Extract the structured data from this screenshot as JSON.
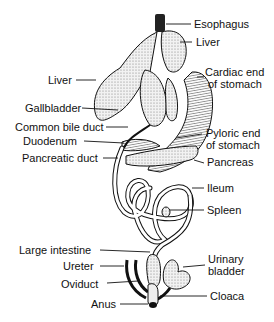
{
  "diagram": {
    "type": "anatomy-illustration",
    "labels_right": [
      {
        "id": "esophagus",
        "text": "Esophagus"
      },
      {
        "id": "liver-right",
        "text": "Liver"
      },
      {
        "id": "cardiac-end",
        "text": "Cardiac end\nof stomach",
        "line1": "Cardiac end",
        "line2": "of stomach"
      },
      {
        "id": "pyloric-end",
        "text": "Pyloric end\nof stomach",
        "line1": "Pyloric end",
        "line2": "of stomach"
      },
      {
        "id": "pancreas",
        "text": "Pancreas"
      },
      {
        "id": "ileum",
        "text": "Ileum"
      },
      {
        "id": "spleen",
        "text": "Spleen"
      },
      {
        "id": "urinary-bladder",
        "text": "Urinary\nbladder",
        "line1": "Urinary",
        "line2": "bladder"
      },
      {
        "id": "cloaca",
        "text": "Cloaca"
      }
    ],
    "labels_left": [
      {
        "id": "liver-left",
        "text": "Liver"
      },
      {
        "id": "gallbladder",
        "text": "Gallbladder"
      },
      {
        "id": "common-bile-duct",
        "text": "Common bile duct"
      },
      {
        "id": "duodenum",
        "text": "Duodenum"
      },
      {
        "id": "pancreatic-duct",
        "text": "Pancreatic duct"
      },
      {
        "id": "large-intestine",
        "text": "Large intestine"
      },
      {
        "id": "ureter",
        "text": "Ureter"
      },
      {
        "id": "oviduct",
        "text": "Oviduct"
      },
      {
        "id": "anus",
        "text": "Anus"
      }
    ]
  },
  "colors": {
    "ink": "#111111",
    "fill": "#e6e6e6",
    "background": "#ffffff"
  }
}
